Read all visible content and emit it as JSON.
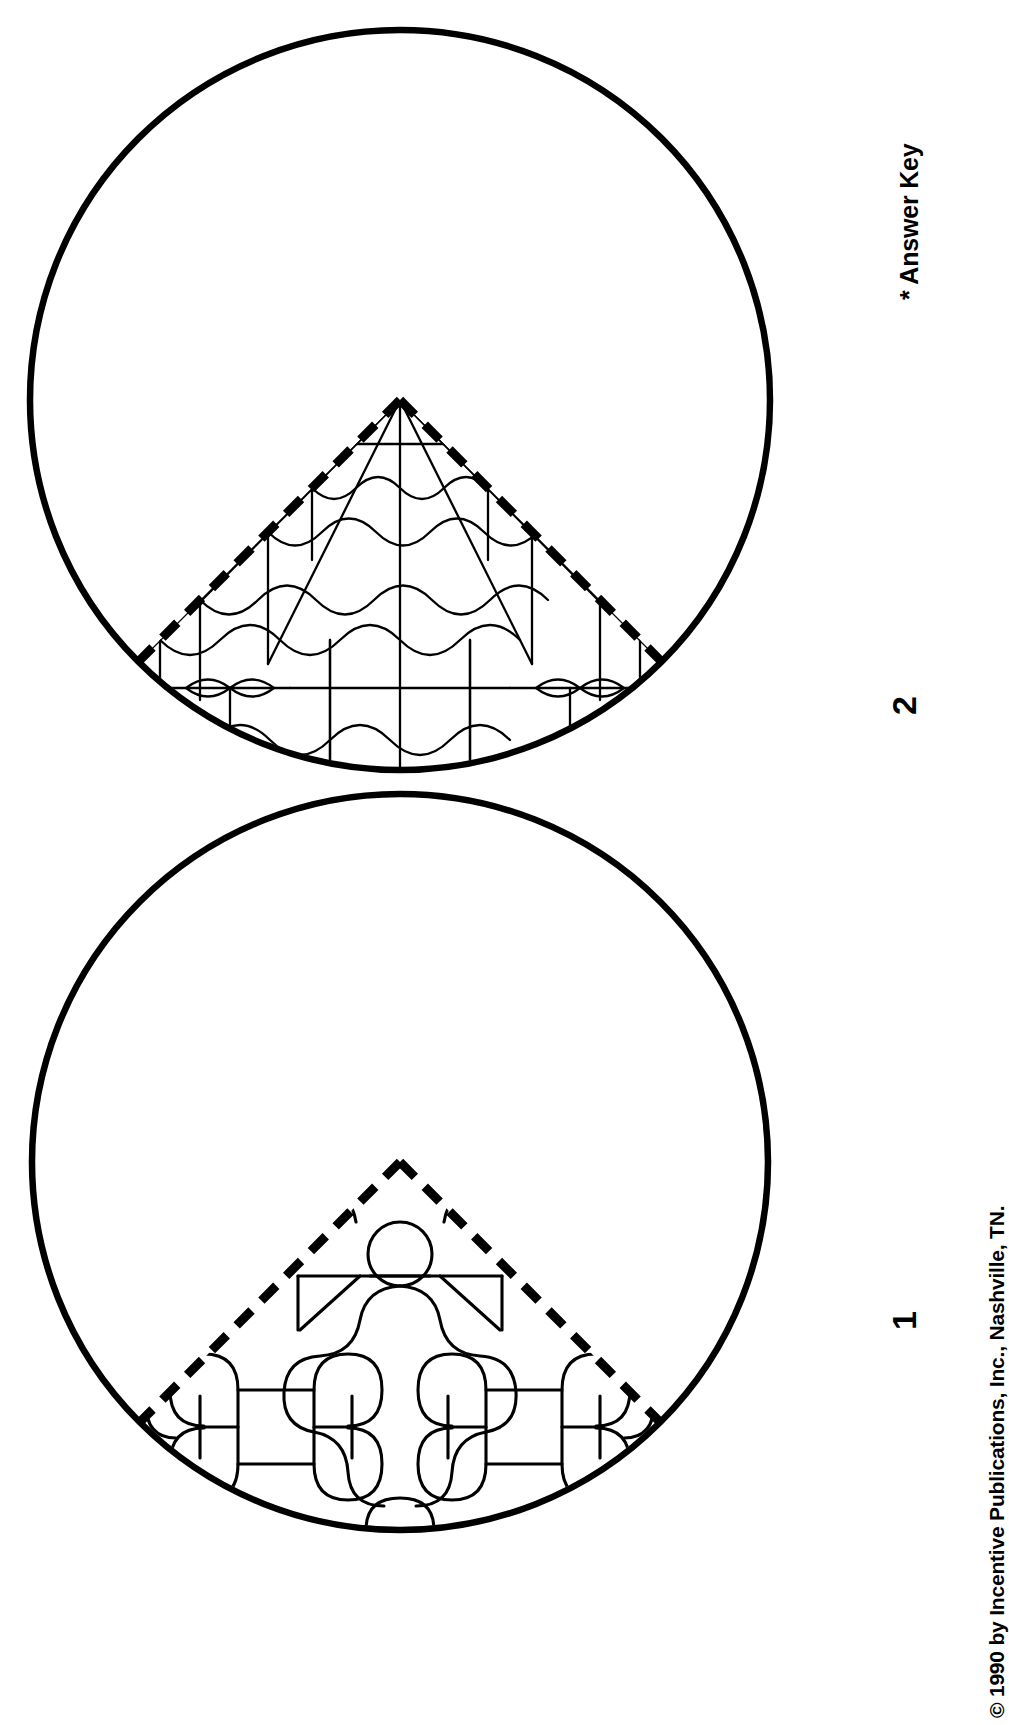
{
  "document": {
    "type": "worksheet-answer-key",
    "orientation": "rotated-90-ccw",
    "background_color": "#ffffff",
    "ink_color": "#000000"
  },
  "labels": {
    "answer_key": "* Answer Key",
    "copyright": "© 1990 by Incentive Publications, Inc., Nashville, TN.",
    "figure_1_number": "1",
    "figure_2_number": "2"
  },
  "figures": [
    {
      "id": "figure-2",
      "number": "2",
      "shape": "circle",
      "outline_style": "solid",
      "sector_angle_degrees": 90,
      "sector_edge_style": "dashed",
      "pattern_name": "wave-grid-tessellation",
      "pattern_symmetry": "bilateral-vertical-mirror",
      "center_x": 400,
      "center_y": 400,
      "radius": 370,
      "stroke_width_outline": 6,
      "stroke_width_pattern": 2.2
    },
    {
      "id": "figure-1",
      "number": "1",
      "shape": "circle",
      "outline_style": "solid",
      "sector_angle_degrees": 90,
      "sector_edge_style": "dashed",
      "pattern_name": "jigsaw-lobe-tessellation",
      "pattern_symmetry": "bilateral-vertical-mirror",
      "center_x": 400,
      "center_y": 392,
      "radius": 368,
      "stroke_width_outline": 6,
      "stroke_width_pattern": 3.0,
      "motifs": [
        "center-circle",
        "square-in-cross",
        "clover-lobes"
      ]
    }
  ]
}
